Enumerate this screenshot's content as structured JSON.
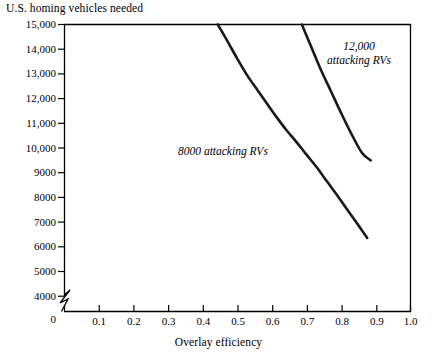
{
  "chart_data": {
    "type": "line",
    "title": "",
    "ylabel": "U.S. homing vehicles needed",
    "xlabel": "Overlay efficiency",
    "xlim": [
      0.0,
      1.0
    ],
    "ylim": [
      4000,
      15000
    ],
    "y_axis_break": true,
    "y_axis_origin_label": "0",
    "grid": false,
    "legend": "inline annotations",
    "xticks": [
      0.0,
      0.1,
      0.2,
      0.3,
      0.4,
      0.5,
      0.6,
      0.7,
      0.8,
      0.9,
      1.0
    ],
    "xtick_labels": [
      "0",
      "0.1",
      "0.2",
      "0.3",
      "0.4",
      "0.5",
      "0.6",
      "0.7",
      "0.8",
      "0.9",
      "1.0"
    ],
    "yticks": [
      4000,
      5000,
      6000,
      7000,
      8000,
      9000,
      10000,
      11000,
      12000,
      13000,
      14000,
      15000
    ],
    "ytick_labels": [
      "4000",
      "5000",
      "6000",
      "7000",
      "8000",
      "9000",
      "10,000",
      "11,000",
      "12,000",
      "13,000",
      "14,000",
      "15,000"
    ],
    "series": [
      {
        "name": "8000 attacking RVs",
        "annotation": "8000 attacking RVs",
        "x": [
          0.443,
          0.47,
          0.5,
          0.53,
          0.56,
          0.59,
          0.613,
          0.64,
          0.67,
          0.7,
          0.73,
          0.76,
          0.79,
          0.82,
          0.875
        ],
        "y": [
          15000,
          14350,
          13600,
          12900,
          12300,
          11700,
          11250,
          10750,
          10250,
          9720,
          9200,
          8620,
          8050,
          7450,
          6360
        ]
      },
      {
        "name": "12,000 attacking RVs",
        "annotation": "12,000 attacking RVs",
        "x": [
          0.686,
          0.71,
          0.74,
          0.77,
          0.8,
          0.83,
          0.86,
          0.885
        ],
        "y": [
          15000,
          14200,
          13200,
          12300,
          11400,
          10550,
          9800,
          9500
        ]
      }
    ]
  },
  "axes": {
    "y_title": "U.S. homing vehicles needed",
    "x_title": "Overlay efficiency",
    "zero_label": "0"
  },
  "colors": {
    "curve": "#1a1a1a",
    "axis": "#000000",
    "background": "#ffffff"
  }
}
